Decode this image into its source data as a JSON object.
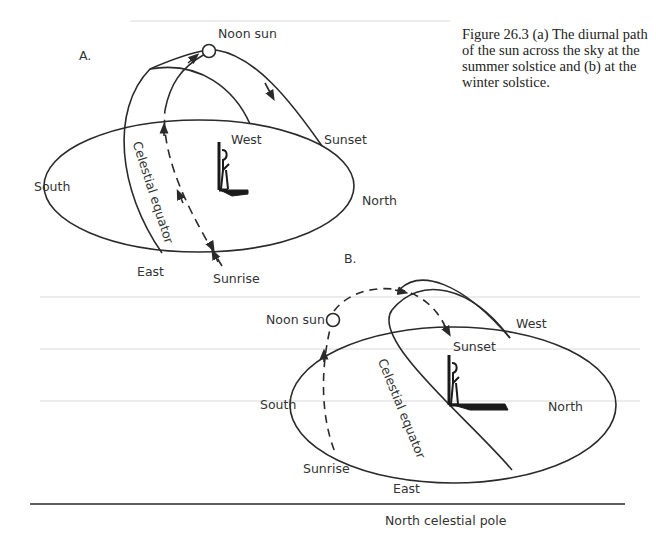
{
  "caption": {
    "text": "Figure 26.3  (a) The diurnal path of the sun across the sky at the summer solstice and  (b) at the winter solstice."
  },
  "panel_a": {
    "label": "A.",
    "noon_sun": "Noon sun",
    "west": "West",
    "sunset": "Sunset",
    "south": "South",
    "north": "North",
    "east": "East",
    "sunrise": "Sunrise",
    "celestial_equator": "Celestial equator"
  },
  "panel_b": {
    "label": "B.",
    "noon_sun": "Noon sun",
    "west": "West",
    "sunset": "Sunset",
    "south": "South",
    "north": "North",
    "east": "East",
    "sunrise": "Sunrise",
    "celestial_equator": "Celestial equator"
  },
  "footer": {
    "label": "North celestial pole"
  },
  "colors": {
    "ink": "#2a2a2a",
    "background": "#ffffff"
  }
}
